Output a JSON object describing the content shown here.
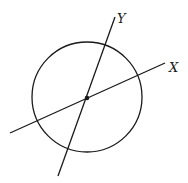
{
  "diagram": {
    "type": "circle-with-rotated-axes",
    "circle": {
      "cx": 87,
      "cy": 97,
      "r": 55
    },
    "center_point": {
      "x": 87,
      "y": 98
    },
    "axes": [
      {
        "label": "X",
        "from": [
          10,
          133
        ],
        "to": [
          165,
          63
        ],
        "label_pos": [
          171,
          71
        ]
      },
      {
        "label": "Y",
        "from": [
          58,
          176
        ],
        "to": [
          115,
          17
        ],
        "label_pos": [
          118,
          23
        ]
      }
    ],
    "stroke_color": "#1a1a1a",
    "background": "#ffffff"
  }
}
